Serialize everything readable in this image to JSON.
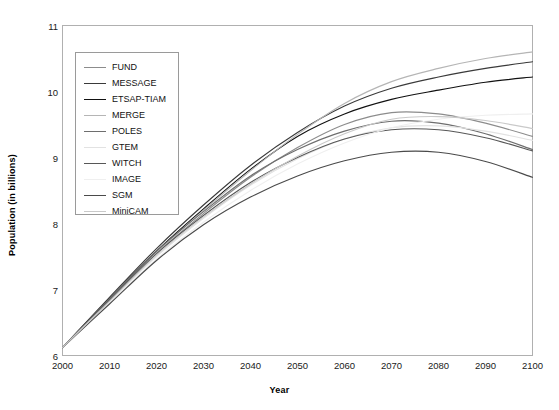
{
  "chart_data": {
    "type": "line",
    "title": "",
    "xlabel": "Year",
    "ylabel": "Population (in billions)",
    "xlim": [
      2000,
      2100
    ],
    "ylim": [
      6,
      11
    ],
    "x": [
      2000,
      2010,
      2020,
      2030,
      2040,
      2050,
      2060,
      2070,
      2080,
      2090,
      2100
    ],
    "xticks": [
      "2000",
      "2010",
      "2020",
      "2030",
      "2040",
      "2050",
      "2060",
      "2070",
      "2080",
      "2090",
      "2100"
    ],
    "yticks": [
      "6",
      "7",
      "8",
      "9",
      "10",
      "11"
    ],
    "grid": false,
    "legend_position": "upper-left",
    "series": [
      {
        "name": "FUND",
        "color": "#8c8c8c",
        "values": [
          6.12,
          6.85,
          7.55,
          8.15,
          8.7,
          9.15,
          9.5,
          9.68,
          9.66,
          9.52,
          9.32
        ]
      },
      {
        "name": "MESSAGE",
        "color": "#3a3a3a",
        "values": [
          6.12,
          6.88,
          7.62,
          8.28,
          8.88,
          9.38,
          9.78,
          10.05,
          10.22,
          10.35,
          10.45
        ]
      },
      {
        "name": "ETSAP-TIAM",
        "color": "#111111",
        "values": [
          6.12,
          6.86,
          7.58,
          8.22,
          8.82,
          9.32,
          9.66,
          9.88,
          10.02,
          10.14,
          10.22
        ]
      },
      {
        "name": "MERGE",
        "color": "#b5b5b5",
        "values": [
          6.12,
          6.84,
          7.56,
          8.2,
          8.8,
          9.35,
          9.82,
          10.15,
          10.35,
          10.5,
          10.6
        ]
      },
      {
        "name": "POLES",
        "color": "#6e6e6e",
        "values": [
          6.12,
          6.86,
          7.58,
          8.18,
          8.72,
          9.12,
          9.4,
          9.55,
          9.52,
          9.36,
          9.12
        ]
      },
      {
        "name": "GTEM",
        "color": "#e2e2e2",
        "values": [
          6.12,
          6.82,
          7.5,
          8.08,
          8.58,
          8.98,
          9.28,
          9.45,
          9.48,
          9.4,
          9.26
        ]
      },
      {
        "name": "WITCH",
        "color": "#575757",
        "values": [
          6.12,
          6.84,
          7.54,
          8.12,
          8.62,
          9.0,
          9.28,
          9.42,
          9.42,
          9.3,
          9.1
        ]
      },
      {
        "name": "IMAGE",
        "color": "#efefef",
        "values": [
          6.12,
          6.8,
          7.46,
          8.02,
          8.5,
          8.9,
          9.22,
          9.45,
          9.58,
          9.64,
          9.66
        ]
      },
      {
        "name": "SGM",
        "color": "#4a4a4a",
        "values": [
          6.12,
          6.78,
          7.44,
          7.98,
          8.4,
          8.72,
          8.95,
          9.08,
          9.08,
          8.94,
          8.7
        ]
      },
      {
        "name": "MiniCAM",
        "color": "#c9c9c9",
        "values": [
          6.12,
          6.82,
          7.52,
          8.1,
          8.6,
          9.02,
          9.36,
          9.58,
          9.62,
          9.56,
          9.44
        ]
      }
    ]
  },
  "legend": {
    "entries": [
      {
        "label": "FUND"
      },
      {
        "label": "MESSAGE"
      },
      {
        "label": "ETSAP-TIAM"
      },
      {
        "label": "MERGE"
      },
      {
        "label": "POLES"
      },
      {
        "label": "GTEM"
      },
      {
        "label": "WITCH"
      },
      {
        "label": "IMAGE"
      },
      {
        "label": "SGM"
      },
      {
        "label": "MiniCAM"
      }
    ]
  },
  "frame": {
    "border_color": "#b0b0b0"
  }
}
